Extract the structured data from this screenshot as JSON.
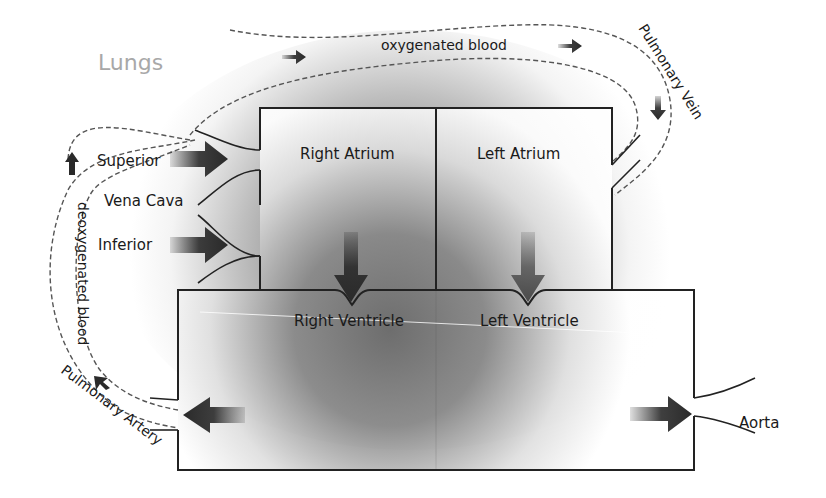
{
  "diagram": {
    "labels": {
      "lungs": "Lungs",
      "oxygenated_blood": "oxygenated blood",
      "pulmonary_vein": "Pulmonary Vein",
      "superior": "Superior",
      "vena_cava": "Vena Cava",
      "inferior": "Inferior",
      "deoxygenated_blood": "deoxygenated blood",
      "pulmonary_artery": "Pulmonary Artery",
      "aorta": "Aorta"
    },
    "chambers": [
      {
        "id": "right-atrium",
        "label": "Right Atrium"
      },
      {
        "id": "left-atrium",
        "label": "Left Atrium"
      },
      {
        "id": "right-ventricle",
        "label": "Right Ventricle"
      },
      {
        "id": "left-ventricle",
        "label": "Left Ventricle"
      }
    ],
    "colors": {
      "outline": "#222222",
      "dashed_path": "#555555",
      "arrow": "#2a2a2a",
      "left_valve_arrow": "#555555",
      "lungs_text": "#a8a8a8",
      "shade_dark": "#6e6e6e"
    }
  }
}
